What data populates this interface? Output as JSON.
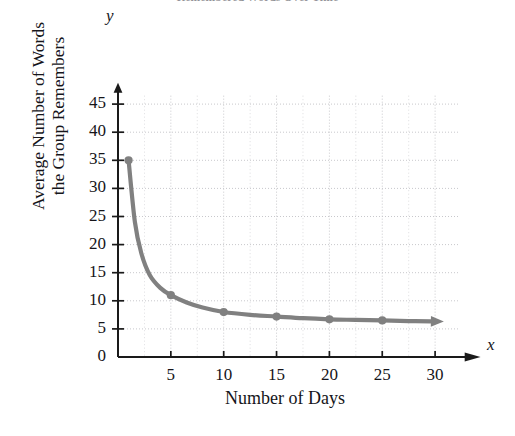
{
  "chart_data": {
    "type": "line",
    "title": "Remembered Words Over Time",
    "xlabel": "Number of Days",
    "ylabel": "Average Number of Words\nthe Group Remembers",
    "x_axis_letter": "x",
    "y_axis_letter": "y",
    "xlim": [
      0,
      32
    ],
    "ylim": [
      0,
      47
    ],
    "xticks": [
      5,
      10,
      15,
      20,
      25,
      30
    ],
    "yticks": [
      0,
      5,
      10,
      15,
      20,
      25,
      30,
      35,
      40,
      45
    ],
    "xtick_labels": [
      "5",
      "10",
      "15",
      "20",
      "25",
      "30"
    ],
    "ytick_labels": [
      "0",
      "5",
      "10",
      "15",
      "20",
      "25",
      "30",
      "35",
      "40",
      "45"
    ],
    "grid": true,
    "grid_style": "dotted",
    "grid_minor_x_step": 2.5,
    "legend": "none",
    "series": [
      {
        "name": "Average words remembered",
        "color": "#808080",
        "marker": "circle",
        "has_end_arrow": true,
        "x": [
          1,
          5,
          10,
          15,
          20,
          25
        ],
        "values": [
          35,
          11,
          8,
          7.2,
          6.7,
          6.5
        ]
      }
    ],
    "curve_points": [
      {
        "x": 1,
        "y": 35
      },
      {
        "x": 1.6,
        "y": 24
      },
      {
        "x": 2.2,
        "y": 18.5
      },
      {
        "x": 3,
        "y": 14.6
      },
      {
        "x": 4,
        "y": 12.3
      },
      {
        "x": 5,
        "y": 11
      },
      {
        "x": 6.5,
        "y": 9.7
      },
      {
        "x": 8,
        "y": 8.8
      },
      {
        "x": 10,
        "y": 8
      },
      {
        "x": 12.5,
        "y": 7.5
      },
      {
        "x": 15,
        "y": 7.2
      },
      {
        "x": 17.5,
        "y": 6.9
      },
      {
        "x": 20,
        "y": 6.7
      },
      {
        "x": 22.5,
        "y": 6.6
      },
      {
        "x": 25,
        "y": 6.5
      },
      {
        "x": 27.5,
        "y": 6.4
      },
      {
        "x": 29.6,
        "y": 6.35
      }
    ]
  },
  "colors": {
    "curve": "#808080",
    "axis": "#1a1a1a",
    "grid": "#c8c8cc",
    "text": "#15151a"
  }
}
